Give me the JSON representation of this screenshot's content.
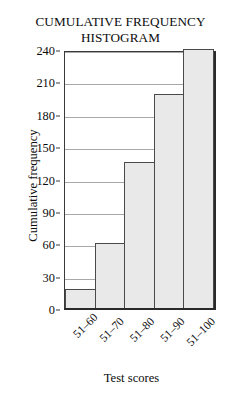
{
  "chart_data": {
    "type": "bar",
    "title": "CUMULATIVE FREQUENCY HISTOGRAM",
    "title_lines": [
      "CUMULATIVE FREQUENCY",
      "HISTOGRAM"
    ],
    "xlabel": "Test scores",
    "ylabel": "Cumulative frequency",
    "categories": [
      "51–60",
      "51–70",
      "51–80",
      "51–90",
      "51–100"
    ],
    "values": [
      18,
      60,
      135,
      198,
      240
    ],
    "ylim": [
      0,
      240
    ],
    "ytick_step": 30,
    "yticks": [
      0,
      30,
      60,
      90,
      120,
      150,
      180,
      210,
      240
    ],
    "ytick_labels": [
      "0",
      "30",
      "60",
      "90",
      "120",
      "150",
      "180",
      "210",
      "240"
    ],
    "grid": true,
    "grid_axis": "y",
    "legend": false,
    "legend_position": "none",
    "bar_gap": 0,
    "colors": {
      "bar_fill": "#e9e9e9",
      "bar_edge": "#4a4a4a",
      "grid": "#a8a8a8",
      "axis": "#2a2a2a",
      "text": "#0c0c0c",
      "background": "#ffffff"
    }
  }
}
